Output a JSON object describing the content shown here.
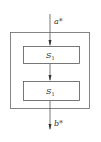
{
  "diagram": {
    "input_label": "a*",
    "output_label": "b*",
    "blocks": [
      {
        "label": "S",
        "subscript": "1"
      },
      {
        "label": "S",
        "subscript": "1"
      }
    ],
    "caption": "",
    "colors": {
      "stroke": "#555555",
      "text": "#333333",
      "background": "#ffffff"
    }
  }
}
